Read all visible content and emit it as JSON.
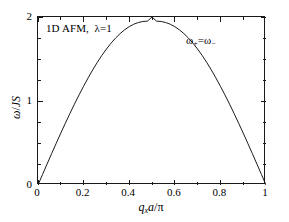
{
  "chart_data": {
    "type": "line",
    "xlabel": "q_x a/π",
    "ylabel": "ω/JS",
    "xlim": [
      0,
      1
    ],
    "ylim": [
      0,
      2
    ],
    "grid": false,
    "legend_position": "none",
    "annotations": [
      {
        "text": "ω+=ω-",
        "x": 0.72,
        "y": 1.82
      }
    ],
    "xticks": [
      0,
      0.2,
      0.4,
      0.6,
      0.8,
      1
    ],
    "xticklabels": [
      "0",
      "0.2",
      "0.4",
      "0.6",
      "0.8",
      "1"
    ],
    "xminorticks": [
      0.1,
      0.3,
      0.5,
      0.7,
      0.9
    ],
    "yticks": [
      0,
      1,
      2
    ],
    "yticklabels": [
      "0",
      "1",
      "2"
    ],
    "yminorticks": [
      0.25,
      0.5,
      0.75,
      1.25,
      1.5,
      1.75
    ],
    "series": [
      {
        "name": "ω+=ω-",
        "formula": "2*sin(pi*x)",
        "color": "#1a1a1a",
        "linewidth": 1,
        "x": [
          0,
          0.02,
          0.04,
          0.06,
          0.08,
          0.1,
          0.12,
          0.14,
          0.16,
          0.18,
          0.2,
          0.22,
          0.24,
          0.26,
          0.28,
          0.3,
          0.32,
          0.34,
          0.36,
          0.38,
          0.4,
          0.42,
          0.44,
          0.46,
          0.48,
          0.5,
          0.52,
          0.54,
          0.56,
          0.58,
          0.6,
          0.62,
          0.64,
          0.66,
          0.68,
          0.7,
          0.72,
          0.74,
          0.76,
          0.78,
          0.8,
          0.82,
          0.84,
          0.86,
          0.88,
          0.9,
          0.92,
          0.94,
          0.96,
          0.98,
          1
        ],
        "y": [
          0,
          0.1256,
          0.2507,
          0.3748,
          0.4973,
          0.618,
          0.7362,
          0.8515,
          0.9635,
          1.0719,
          1.1756,
          1.276,
          1.3705,
          1.4595,
          1.5427,
          1.618,
          1.6871,
          1.7485,
          1.8021,
          1.8477,
          1.885,
          1.914,
          1.9346,
          1.9468,
          1.9506,
          2.0,
          1.9506,
          1.9468,
          1.9346,
          1.914,
          1.885,
          1.8477,
          1.8021,
          1.7485,
          1.6871,
          1.618,
          1.5427,
          1.4595,
          1.3705,
          1.276,
          1.1756,
          1.0719,
          0.9635,
          0.8515,
          0.7362,
          0.618,
          0.4973,
          0.3748,
          0.2507,
          0.1256,
          0
        ]
      }
    ]
  },
  "labels": {
    "title_main": "1D AFM,",
    "title_lambda": "λ=1",
    "omega_left": "ω",
    "omega_sub_plus": "+",
    "equals": "=",
    "omega_right": "ω",
    "omega_sub_minus": "−",
    "y_axis_omega": "ω",
    "y_axis_slash": "/",
    "y_axis_js": "JS",
    "x_axis_q": "q",
    "x_axis_q_sub": "x",
    "x_axis_a": "a",
    "x_axis_slash": "/",
    "x_axis_pi": "π"
  }
}
